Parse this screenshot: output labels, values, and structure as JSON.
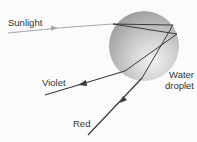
{
  "labels": {
    "sunlight": "Sunlight",
    "violet": "Violet",
    "red": "Red",
    "water_line1": "Water",
    "water_line2": "droplet"
  },
  "colors": {
    "background": "#fbfbfb",
    "incoming_ray": "#a8a8a8",
    "ray": "#3a3a3a",
    "droplet_light": "#e6e6e6",
    "droplet_dark": "#9a9a9a",
    "text": "#333333"
  }
}
